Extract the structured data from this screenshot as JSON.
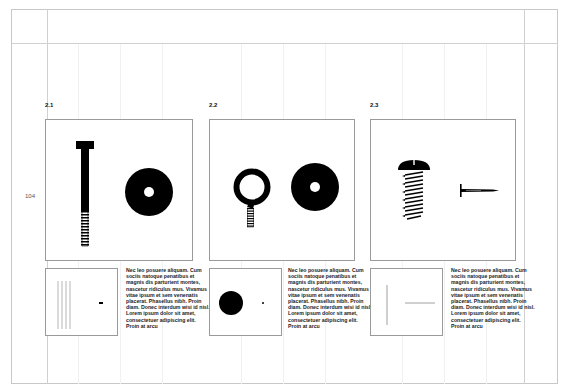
{
  "page": {
    "page_number": "104",
    "colors": {
      "frame": "#c8c8c8",
      "box_border": "#9a9a9a",
      "ink": "#000000"
    }
  },
  "figures": [
    {
      "label": "2.1",
      "main_image": {
        "objects": [
          "hex-bolt",
          "flat-washer"
        ]
      },
      "thumbnail": {
        "objects": [
          "vertical-lines",
          "small-dash"
        ]
      },
      "caption": "Nec leo posuere aliquam. Cum sociis natoque penatibus et magnis dis parturient montes, nascetur ridiculus mus. Vivamus vitae ipsum et sem venenatis placerat. Phasellus nibh. Proin diam. Donec interdum wisi id nisl. Lorem ipsum dolor sit amet, consectetuer adipiscing elit. Proin at arcu"
    },
    {
      "label": "2.2",
      "main_image": {
        "objects": [
          "eye-bolt",
          "flat-washer"
        ]
      },
      "thumbnail": {
        "objects": [
          "filled-circle",
          "dot"
        ]
      },
      "caption": "Nec leo posuere aliquam. Cum sociis natoque penatibus et magnis dis parturient montes, nascetur ridiculus mus. Vivamus vitae ipsum et sem venenatis placerat. Phasellus nibh. Proin diam. Donec interdum wisi id nisl. Lorem ipsum dolor sit amet, consectetuer adipiscing elit. Proin at arcu"
    },
    {
      "label": "2.3",
      "main_image": {
        "objects": [
          "round-head-screw",
          "nail"
        ]
      },
      "thumbnail": {
        "objects": [
          "vertical-line",
          "horizontal-line"
        ]
      },
      "caption": "Nec leo posuere aliquam. Cum sociis natoque penatibus et magnis dis parturient montes, nascetur ridiculus mus. Vivamus vitae ipsum et sem venenatis placerat. Phasellus nibh. Proin diam. Donec interdum wisi id nisl. Lorem ipsum dolor sit amet, consectetuer adipiscing elit. Proin at arcu"
    }
  ]
}
